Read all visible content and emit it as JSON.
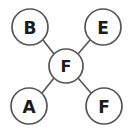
{
  "diagram": {
    "type": "node-link-graph",
    "background_color": "#ffffff",
    "node_fill_color": "#ffffff",
    "node_stroke_color": "#55555a",
    "edge_color": "#55555a",
    "label_color": "#1b1b1b",
    "nodes": [
      {
        "id": "top-left",
        "label": "B",
        "cx": 30,
        "cy": 27,
        "r": 18
      },
      {
        "id": "top-right",
        "label": "E",
        "cx": 103,
        "cy": 27,
        "r": 18
      },
      {
        "id": "center",
        "label": "F",
        "cx": 66,
        "cy": 66,
        "r": 17
      },
      {
        "id": "bottom-left",
        "label": "A",
        "cx": 29,
        "cy": 106,
        "r": 18
      },
      {
        "id": "bottom-right",
        "label": "F",
        "cx": 104,
        "cy": 106,
        "r": 18
      }
    ],
    "edges": [
      {
        "id": "edge-center-top-left",
        "from": "center",
        "to": "top-left",
        "x1": 54,
        "y1": 54,
        "x2": 43,
        "y2": 40
      },
      {
        "id": "edge-center-top-right",
        "from": "center",
        "to": "top-right",
        "x1": 78,
        "y1": 54,
        "x2": 90,
        "y2": 40
      },
      {
        "id": "edge-center-bottom-left",
        "from": "center",
        "to": "bottom-left",
        "x1": 54,
        "y1": 78,
        "x2": 42,
        "y2": 93
      },
      {
        "id": "edge-center-bottom-right",
        "from": "center",
        "to": "bottom-right",
        "x1": 78,
        "y1": 78,
        "x2": 91,
        "y2": 93
      }
    ]
  }
}
